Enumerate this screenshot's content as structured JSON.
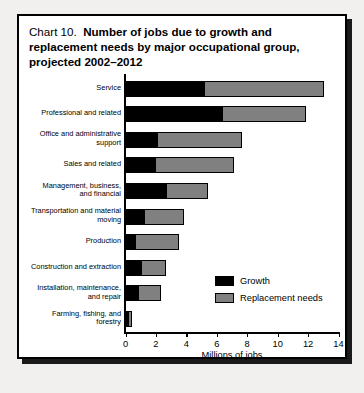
{
  "title": {
    "prefix": "Chart 10.",
    "line1_bold": "Number of jobs due to growth and",
    "line2": "replacement needs by major occupational group,",
    "line3": "projected 2002–2012"
  },
  "legend": {
    "position": "inside-right",
    "items": [
      {
        "label": "Growth",
        "color": "#000000"
      },
      {
        "label": "Replacement needs",
        "color": "#808080"
      }
    ]
  },
  "colors": {
    "growth": "#000000",
    "replacement": "#808080",
    "page_background": "#f1f0ee",
    "figure_background": "#ffffff",
    "border": "#000000"
  },
  "chart_data": {
    "type": "bar",
    "orientation": "horizontal",
    "stacked": true,
    "xlabel": "Millions of jobs",
    "ylabel": "",
    "xlim": [
      0,
      14
    ],
    "xticks": [
      0,
      2,
      4,
      6,
      8,
      10,
      12,
      14
    ],
    "xtick_labels": [
      "0",
      "2",
      "4",
      "6",
      "8",
      "10",
      "12",
      "14"
    ],
    "grid": false,
    "categories": [
      "Service",
      "Professional and related",
      "Office and administrative support",
      "Sales and related",
      "Management, business, and financial",
      "Transportation and material moving",
      "Production",
      "Construction and extraction",
      "Installation, maintenance, and repair",
      "Farming, fishing, and forestry"
    ],
    "category_label_lines": [
      [
        "Service"
      ],
      [
        "Professional and related"
      ],
      [
        "Office and administrative",
        "support"
      ],
      [
        "Sales and related"
      ],
      [
        "Management, business,",
        "and financial"
      ],
      [
        "Transportation and material",
        "moving"
      ],
      [
        "Production"
      ],
      [
        "Construction and extraction"
      ],
      [
        "Installation, maintenance,",
        "and repair"
      ],
      [
        "Farming, fishing, and",
        "forestry"
      ]
    ],
    "series": [
      {
        "name": "Growth",
        "color": "#000000",
        "values": [
          5.1,
          6.3,
          2.0,
          1.9,
          2.6,
          1.2,
          0.6,
          1.0,
          0.8,
          0.1
        ]
      },
      {
        "name": "Replacement needs",
        "color": "#808080",
        "values": [
          7.8,
          5.4,
          5.5,
          5.1,
          2.7,
          2.5,
          2.8,
          1.5,
          1.4,
          0.2
        ]
      }
    ],
    "totals": [
      12.9,
      11.7,
      7.5,
      7.0,
      5.3,
      3.7,
      3.4,
      2.5,
      2.2,
      0.3
    ]
  }
}
